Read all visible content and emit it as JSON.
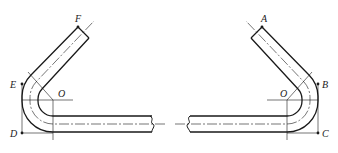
{
  "diagram": {
    "type": "bent-pipe-technical-drawing",
    "left_pipe": {
      "labels": {
        "end": "F",
        "tangent": "E",
        "center": "O",
        "corner": "D"
      }
    },
    "right_pipe": {
      "labels": {
        "end": "A",
        "tangent": "B",
        "center": "O",
        "corner": "C"
      }
    },
    "colors": {
      "line": "#1a1a1a",
      "background": "#ffffff"
    }
  }
}
